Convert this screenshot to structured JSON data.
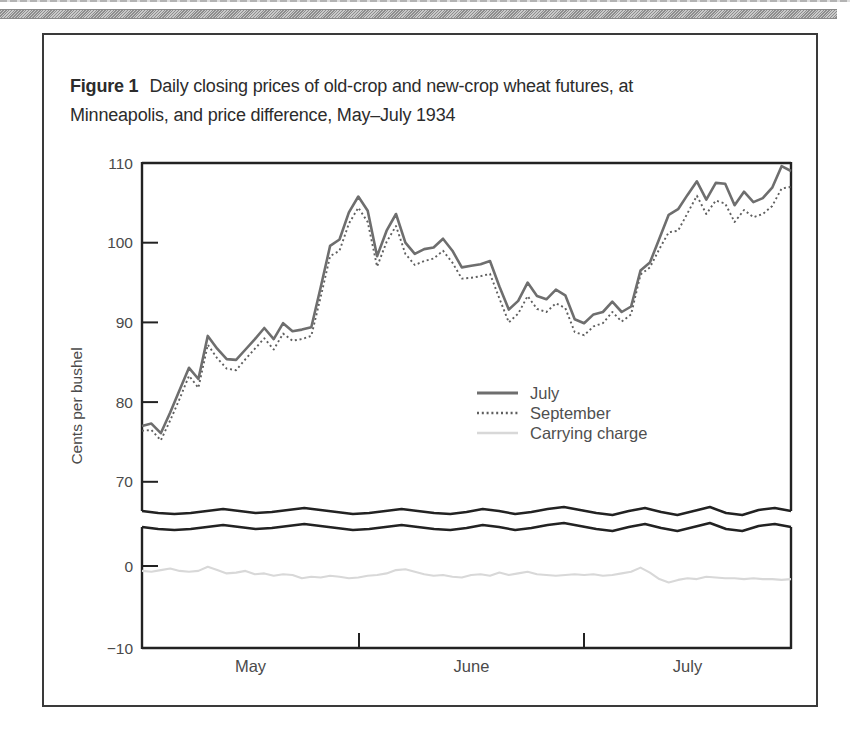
{
  "figure": {
    "label": "Figure 1",
    "title_line1": "Daily closing prices of old-crop and new-crop wheat futures, at",
    "title_line2": "Minneapolis, and price difference, May–July 1934"
  },
  "colors": {
    "axis": "#222222",
    "tick_text": "#4a4a4a",
    "legend_text": "#4f4f4f",
    "july_line": "#6e6e6e",
    "september_line": "#5f5f5f",
    "carrying_line": "#d8d8d8"
  },
  "chart_data": {
    "type": "line",
    "xlabel": "",
    "ylabel": "Cents per bushel",
    "x_categories": [
      "May",
      "June",
      "July"
    ],
    "grid": false,
    "legend_position": "center-right",
    "legend_entries": [
      "July",
      "September",
      "Carrying charge"
    ],
    "yticks": [
      {
        "label": "110",
        "value": 110
      },
      {
        "label": "100",
        "value": 100
      },
      {
        "label": "90",
        "value": 90
      },
      {
        "label": "80",
        "value": 80
      },
      {
        "label": "70",
        "value": 70
      },
      {
        "label": "0",
        "value": 0
      },
      {
        "label": "−10",
        "value": -10
      }
    ],
    "ylim_upper": [
      66,
      110
    ],
    "ylim_lower": [
      -10,
      5
    ],
    "axis_break": {
      "enabled": true,
      "offsets": [
        0,
        2,
        3,
        2,
        0,
        -2,
        0,
        2,
        1,
        -1,
        -3,
        -1,
        1,
        3,
        2,
        0,
        -2,
        0,
        2,
        3,
        1,
        -2,
        0,
        3,
        1,
        -2,
        -4,
        -1,
        2,
        4,
        0,
        -3,
        1,
        4,
        0,
        -4,
        2,
        4,
        -1,
        -3,
        0
      ]
    },
    "series": [
      {
        "name": "July",
        "style": "solid",
        "scale": "upper",
        "values": [
          77.0,
          77.3,
          76.1,
          78.7,
          81.5,
          84.3,
          82.9,
          88.3,
          86.7,
          85.4,
          85.3,
          86.6,
          87.9,
          89.3,
          87.9,
          89.9,
          88.9,
          89.1,
          89.4,
          94.4,
          99.6,
          100.4,
          103.8,
          105.8,
          104.0,
          98.3,
          101.5,
          103.6,
          100.0,
          98.6,
          99.2,
          99.4,
          100.5,
          99.0,
          96.9,
          97.1,
          97.3,
          97.7,
          94.5,
          91.6,
          92.7,
          95.0,
          93.3,
          92.9,
          94.1,
          93.4,
          90.4,
          89.9,
          91.0,
          91.3,
          92.6,
          91.3,
          92.0,
          96.5,
          97.5,
          100.5,
          103.5,
          104.2,
          106.0,
          107.7,
          105.4,
          107.5,
          107.4,
          104.7,
          106.4,
          105.1,
          105.6,
          106.9,
          109.6,
          109.0
        ]
      },
      {
        "name": "September",
        "style": "dotted",
        "scale": "upper",
        "values": [
          76.4,
          76.5,
          75.2,
          77.7,
          80.4,
          83.3,
          81.8,
          87.2,
          85.5,
          84.2,
          84.0,
          85.4,
          86.7,
          88.0,
          86.6,
          88.6,
          87.7,
          87.9,
          88.3,
          93.2,
          98.3,
          99.0,
          102.4,
          104.4,
          102.6,
          97.0,
          100.1,
          102.1,
          98.6,
          97.2,
          97.7,
          98.0,
          99.0,
          97.5,
          95.5,
          95.6,
          95.8,
          96.1,
          93.0,
          90.0,
          91.1,
          93.3,
          91.7,
          91.3,
          92.4,
          91.8,
          88.8,
          88.4,
          89.5,
          89.9,
          91.3,
          90.1,
          91.0,
          96.0,
          96.9,
          99.2,
          101.3,
          101.5,
          103.7,
          105.9,
          103.6,
          105.3,
          104.9,
          102.6,
          104.1,
          103.2,
          103.6,
          104.6,
          106.8,
          107.0
        ]
      },
      {
        "name": "Carrying charge",
        "style": "solid-light",
        "scale": "lower",
        "values": [
          -0.6,
          -0.7,
          -0.5,
          -0.3,
          -0.6,
          -0.7,
          -0.6,
          -0.1,
          -0.5,
          -0.9,
          -0.8,
          -0.6,
          -1.0,
          -0.9,
          -1.2,
          -1.0,
          -1.1,
          -1.5,
          -1.3,
          -1.4,
          -1.2,
          -1.3,
          -1.5,
          -1.4,
          -1.2,
          -1.1,
          -0.9,
          -0.5,
          -0.4,
          -0.7,
          -1.0,
          -1.2,
          -1.1,
          -1.3,
          -1.4,
          -1.1,
          -1.0,
          -1.2,
          -0.8,
          -1.1,
          -0.9,
          -0.7,
          -1.0,
          -1.1,
          -1.2,
          -1.1,
          -1.0,
          -1.1,
          -1.0,
          -1.2,
          -1.1,
          -0.9,
          -0.7,
          -0.2,
          -0.8,
          -1.6,
          -2.0,
          -1.7,
          -1.5,
          -1.6,
          -1.3,
          -1.4,
          -1.5,
          -1.5,
          -1.6,
          -1.5,
          -1.6,
          -1.6,
          -1.7,
          -1.6
        ]
      }
    ]
  }
}
